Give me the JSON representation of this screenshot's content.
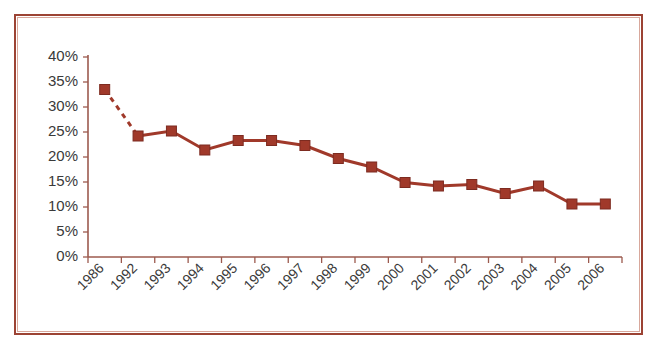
{
  "figure": {
    "border_color": "#9c4334",
    "inner_border_color": "#d8a89c",
    "background": "#ffffff"
  },
  "chart_data": {
    "type": "line",
    "title": "",
    "subtitle": "",
    "xlabel": "",
    "ylabel": "",
    "categories": [
      "1986",
      "1992",
      "1993",
      "1994",
      "1995",
      "1996",
      "1997",
      "1998",
      "1999",
      "2000",
      "2001",
      "2002",
      "2003",
      "2004",
      "2005",
      "2006"
    ],
    "values": [
      33.5,
      24.2,
      25.2,
      21.4,
      23.3,
      23.3,
      22.3,
      19.7,
      18.0,
      14.9,
      14.2,
      14.5,
      12.7,
      14.2,
      10.6,
      10.6
    ],
    "series": [
      {
        "name": "percent",
        "values": [
          33.5,
          24.2,
          25.2,
          21.4,
          23.3,
          23.3,
          22.3,
          19.7,
          18.0,
          14.9,
          14.2,
          14.5,
          12.7,
          14.2,
          10.6,
          10.6
        ],
        "color": "#a0392a",
        "marker": "square",
        "first_segment_style": "dashed"
      }
    ],
    "ylim": [
      0,
      40
    ],
    "ytick_values": [
      0,
      5,
      10,
      15,
      20,
      25,
      30,
      35,
      40
    ],
    "ytick_labels": [
      "0%",
      "5%",
      "10%",
      "15%",
      "20%",
      "25%",
      "30%",
      "35%",
      "40%"
    ],
    "xtick_labels": [
      "1986",
      "1992",
      "1993",
      "1994",
      "1995",
      "1996",
      "1997",
      "1998",
      "1999",
      "2000",
      "2001",
      "2002",
      "2003",
      "2004",
      "2005",
      "2006"
    ],
    "xtick_label_rotation": -45,
    "grid": false,
    "legend": false,
    "legend_position": "none",
    "annotations": [],
    "line_color": "#a0392a",
    "axis_color": "#9c5a4e"
  }
}
